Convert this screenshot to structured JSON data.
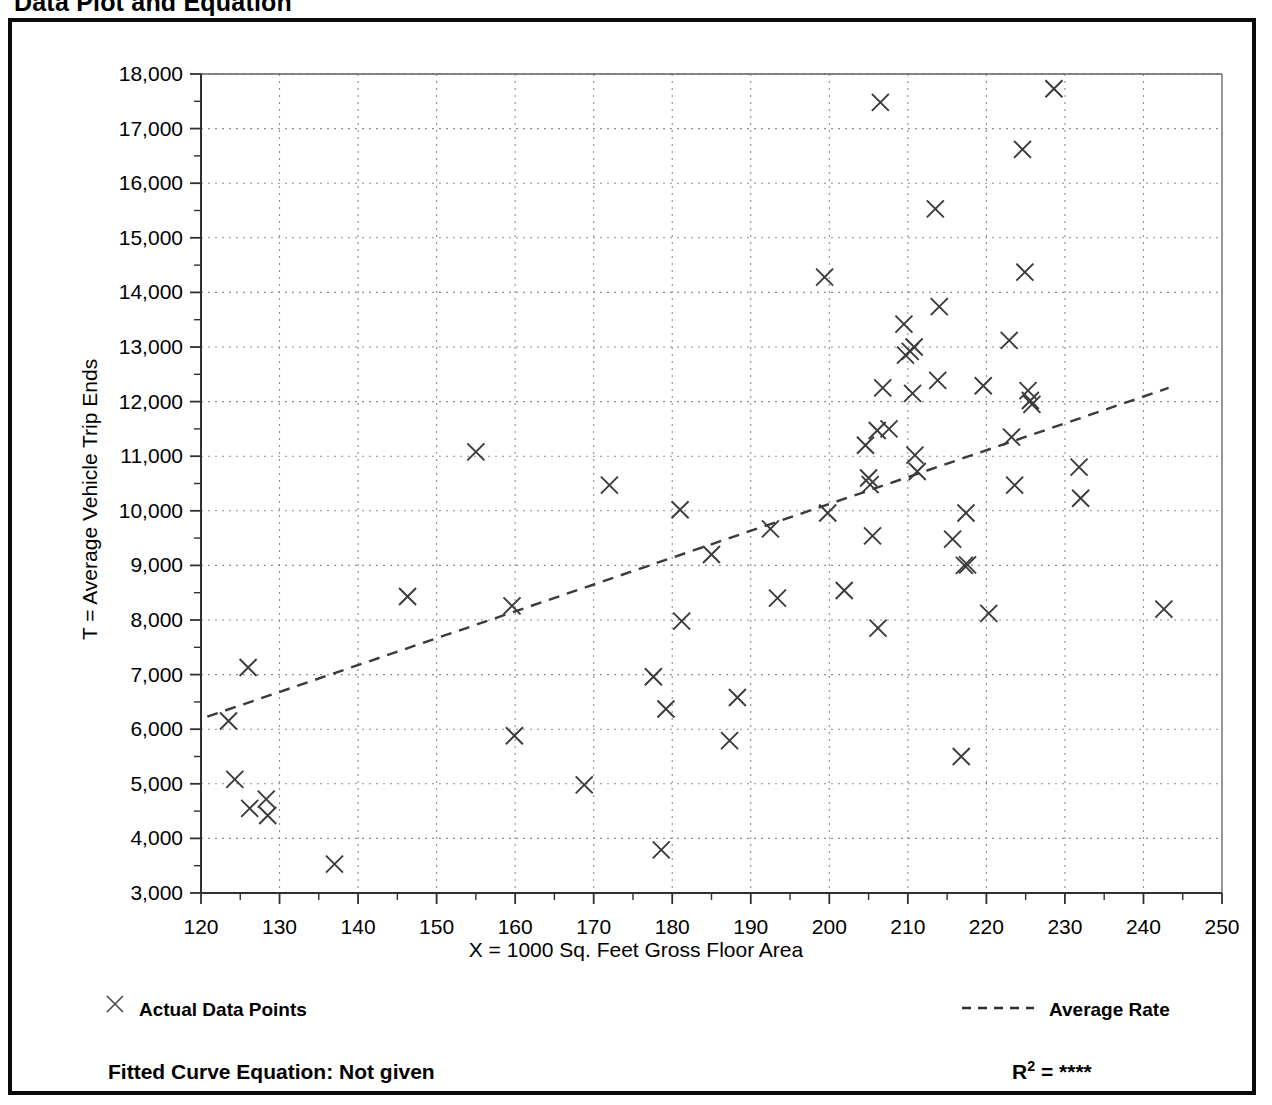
{
  "title": "Data Plot and Equation",
  "legend": {
    "points_label": "Actual Data Points",
    "rate_label": "Average Rate",
    "point_marker_icon": "x-marker-icon",
    "rate_line_icon": "dashed-line-icon"
  },
  "footer": {
    "equation_label": "Fitted Curve Equation:  Not given",
    "r2_prefix": "R",
    "r2_exponent": "2",
    "r2_value": " = ****"
  },
  "chart_data": {
    "type": "scatter",
    "title": "Data Plot and Equation",
    "xlabel": "X = 1000 Sq. Feet Gross Floor Area",
    "ylabel": "T = Average Vehicle Trip Ends",
    "xlim": [
      120,
      250
    ],
    "ylim": [
      3000,
      18000
    ],
    "xticks": [
      120,
      130,
      140,
      150,
      160,
      170,
      180,
      190,
      200,
      210,
      220,
      230,
      240,
      250
    ],
    "xtick_labels": [
      "120",
      "130",
      "140",
      "150",
      "160",
      "170",
      "180",
      "190",
      "200",
      "210",
      "220",
      "230",
      "240",
      "250"
    ],
    "xminor_step": 5,
    "yticks": [
      3000,
      4000,
      5000,
      6000,
      7000,
      8000,
      9000,
      10000,
      11000,
      12000,
      13000,
      14000,
      15000,
      16000,
      17000,
      18000
    ],
    "ytick_labels": [
      "3,000",
      "4,000",
      "5,000",
      "6,000",
      "7,000",
      "8,000",
      "9,000",
      "10,000",
      "11,000",
      "12,000",
      "13,000",
      "14,000",
      "15,000",
      "16,000",
      "17,000",
      "18,000"
    ],
    "yminor_step": 500,
    "grid": true,
    "grid_style": "dotted",
    "legend_position": "below-axes",
    "series": [
      {
        "name": "Actual Data Points",
        "marker": "x",
        "color": "#3a3a3a",
        "points": [
          [
            123.5,
            6150
          ],
          [
            124.3,
            5080
          ],
          [
            126.2,
            4550
          ],
          [
            128.3,
            4720
          ],
          [
            128.5,
            4420
          ],
          [
            126.0,
            7130
          ],
          [
            137.0,
            3530
          ],
          [
            146.3,
            8430
          ],
          [
            155.0,
            11080
          ],
          [
            159.6,
            8260
          ],
          [
            159.9,
            5880
          ],
          [
            168.8,
            4980
          ],
          [
            172.0,
            10470
          ],
          [
            177.6,
            6960
          ],
          [
            178.6,
            3790
          ],
          [
            179.2,
            6370
          ],
          [
            181.0,
            10020
          ],
          [
            181.2,
            7980
          ],
          [
            185.0,
            9200
          ],
          [
            187.3,
            5790
          ],
          [
            188.3,
            6580
          ],
          [
            192.5,
            9670
          ],
          [
            193.4,
            8400
          ],
          [
            199.4,
            14280
          ],
          [
            199.8,
            9960
          ],
          [
            201.9,
            8540
          ],
          [
            204.6,
            11200
          ],
          [
            205.0,
            10600
          ],
          [
            205.2,
            10480
          ],
          [
            205.5,
            9540
          ],
          [
            206.2,
            7850
          ],
          [
            206.1,
            11470
          ],
          [
            206.8,
            12250
          ],
          [
            206.5,
            17480
          ],
          [
            207.6,
            11500
          ],
          [
            209.5,
            13420
          ],
          [
            209.7,
            12850
          ],
          [
            210.3,
            12920
          ],
          [
            210.6,
            12150
          ],
          [
            210.8,
            13000
          ],
          [
            210.9,
            11020
          ],
          [
            211.2,
            10720
          ],
          [
            213.5,
            15530
          ],
          [
            213.8,
            12390
          ],
          [
            214.0,
            13740
          ],
          [
            215.7,
            9480
          ],
          [
            216.8,
            5500
          ],
          [
            217.2,
            9000
          ],
          [
            217.6,
            9010
          ],
          [
            217.4,
            9960
          ],
          [
            219.6,
            12290
          ],
          [
            220.3,
            8120
          ],
          [
            222.9,
            13120
          ],
          [
            223.2,
            11350
          ],
          [
            223.6,
            10470
          ],
          [
            224.6,
            16620
          ],
          [
            224.9,
            14370
          ],
          [
            225.3,
            12200
          ],
          [
            225.6,
            12020
          ],
          [
            225.8,
            11950
          ],
          [
            228.6,
            17730
          ],
          [
            231.8,
            10800
          ],
          [
            232.0,
            10230
          ],
          [
            242.6,
            8200
          ]
        ]
      },
      {
        "name": "Average Rate",
        "type": "line",
        "style": "dashed",
        "color": "#3a3a3a",
        "points": [
          [
            120.8,
            6230
          ],
          [
            243.2,
            12250
          ]
        ]
      }
    ]
  }
}
